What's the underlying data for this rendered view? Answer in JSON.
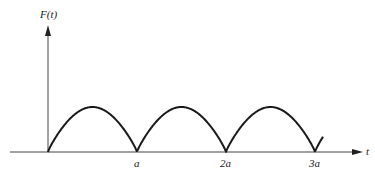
{
  "figure": {
    "y_axis_label": "F(t)",
    "x_axis_label": "t",
    "tick_labels": [
      "a",
      "2a",
      "3a"
    ],
    "colors": {
      "stroke": "#1a1a1a",
      "axis": "#444444",
      "background": "#ffffff"
    }
  },
  "chart_data": {
    "type": "line",
    "title": "",
    "xlabel": "t",
    "ylabel": "F(t)",
    "function": "F(t) = |sin(pi t / a)|",
    "period": "a",
    "x_ticks": [
      {
        "value": 1,
        "label": "a"
      },
      {
        "value": 2,
        "label": "2a"
      },
      {
        "value": 3,
        "label": "3a"
      }
    ],
    "xlim": [
      0,
      3.1
    ],
    "ylim": [
      0,
      1
    ],
    "grid": false,
    "legend": null
  }
}
